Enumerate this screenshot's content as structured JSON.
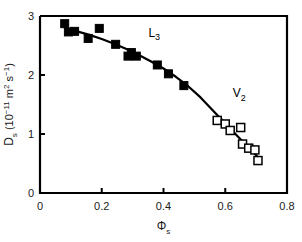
{
  "chart_data": {
    "type": "scatter",
    "title": "",
    "xlabel": "Φs",
    "xlabel_base": "Φ",
    "xlabel_sub": "s",
    "ylabel": "Ds (10-11 m2 s-1)",
    "ylabel_base": "D",
    "ylabel_sub": "s",
    "ylabel_unit_open": " (10",
    "ylabel_unit_exp1": "−11",
    "ylabel_unit_m": " m",
    "ylabel_unit_exp2": "2",
    "ylabel_unit_s": " s",
    "ylabel_unit_exp3": "−1",
    "ylabel_unit_close": ")",
    "xlim": [
      0,
      0.8
    ],
    "ylim": [
      0,
      3
    ],
    "xticks": [
      0,
      0.2,
      0.4,
      0.6,
      0.8
    ],
    "xtick_labels": [
      "0",
      "0.2",
      "0.4",
      "0.6",
      "0.8"
    ],
    "yticks": [
      0,
      1,
      2,
      3
    ],
    "ytick_labels": [
      "0",
      "1",
      "2",
      "3"
    ],
    "grid": false,
    "legend_position": "inline-annotations",
    "annotations": [
      {
        "text": "L3",
        "base": "L",
        "sub": "3",
        "x": 0.37,
        "y": 2.65
      },
      {
        "text": "V2",
        "base": "V",
        "sub": "2",
        "x": 0.645,
        "y": 1.62
      }
    ],
    "series": [
      {
        "name": "L3",
        "marker": "filled-square",
        "color": "#000000",
        "points": [
          {
            "x": 0.08,
            "y": 2.87
          },
          {
            "x": 0.092,
            "y": 2.73
          },
          {
            "x": 0.112,
            "y": 2.74
          },
          {
            "x": 0.156,
            "y": 2.62
          },
          {
            "x": 0.192,
            "y": 2.79
          },
          {
            "x": 0.245,
            "y": 2.52
          },
          {
            "x": 0.285,
            "y": 2.32
          },
          {
            "x": 0.296,
            "y": 2.38
          },
          {
            "x": 0.312,
            "y": 2.32
          },
          {
            "x": 0.38,
            "y": 2.17
          },
          {
            "x": 0.416,
            "y": 2.02
          },
          {
            "x": 0.466,
            "y": 1.82
          }
        ]
      },
      {
        "name": "V2",
        "marker": "open-square",
        "color": "#000000",
        "points": [
          {
            "x": 0.574,
            "y": 1.23
          },
          {
            "x": 0.6,
            "y": 1.17
          },
          {
            "x": 0.616,
            "y": 1.06
          },
          {
            "x": 0.65,
            "y": 1.11
          },
          {
            "x": 0.656,
            "y": 0.83
          },
          {
            "x": 0.676,
            "y": 0.76
          },
          {
            "x": 0.696,
            "y": 0.73
          },
          {
            "x": 0.706,
            "y": 0.55
          }
        ]
      }
    ],
    "fit_curve": {
      "name": "fit-line",
      "color": "#000000",
      "points": [
        {
          "x": 0.08,
          "y": 2.8
        },
        {
          "x": 0.12,
          "y": 2.74
        },
        {
          "x": 0.16,
          "y": 2.68
        },
        {
          "x": 0.2,
          "y": 2.61
        },
        {
          "x": 0.24,
          "y": 2.53
        },
        {
          "x": 0.28,
          "y": 2.44
        },
        {
          "x": 0.32,
          "y": 2.34
        },
        {
          "x": 0.36,
          "y": 2.23
        },
        {
          "x": 0.4,
          "y": 2.11
        },
        {
          "x": 0.44,
          "y": 1.97
        },
        {
          "x": 0.48,
          "y": 1.81
        },
        {
          "x": 0.52,
          "y": 1.62
        },
        {
          "x": 0.56,
          "y": 1.4
        },
        {
          "x": 0.6,
          "y": 1.18
        },
        {
          "x": 0.64,
          "y": 0.96
        },
        {
          "x": 0.67,
          "y": 0.8
        },
        {
          "x": 0.7,
          "y": 0.64
        },
        {
          "x": 0.712,
          "y": 0.57
        }
      ]
    }
  }
}
